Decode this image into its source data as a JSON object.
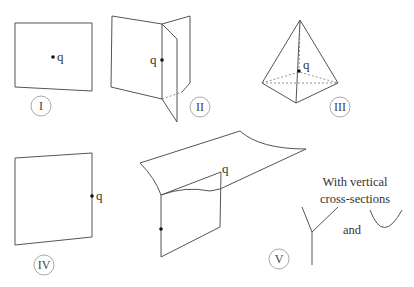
{
  "figures": [
    {
      "id": "I",
      "label": "I",
      "point_label": "q"
    },
    {
      "id": "II",
      "label": "II",
      "point_label": "q"
    },
    {
      "id": "III",
      "label": "III",
      "point_label": "q"
    },
    {
      "id": "IV",
      "label": "IV",
      "point_label": "q"
    },
    {
      "id": "V",
      "label": "V",
      "point_label": "q"
    }
  ],
  "caption": {
    "line1": "With vertical",
    "line2": "cross-sections",
    "conjunction": "and"
  }
}
